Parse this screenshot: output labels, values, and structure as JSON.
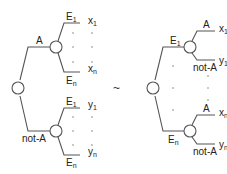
{
  "diagram": {
    "type": "decision-tree-equivalence",
    "relation_symbol": "~",
    "left_tree": {
      "root": "decision",
      "branches": [
        {
          "label": "A",
          "chance_node": true,
          "outcomes": [
            {
              "event": "E",
              "event_sub": "1",
              "result": "x",
              "result_sub": "1"
            },
            {
              "event": "E",
              "event_sub": "n",
              "result": "x",
              "result_sub": "n"
            }
          ]
        },
        {
          "label": "not-A",
          "chance_node": true,
          "outcomes": [
            {
              "event": "E",
              "event_sub": "1",
              "result": "y",
              "result_sub": "1"
            },
            {
              "event": "E",
              "event_sub": "n",
              "result": "y",
              "result_sub": "n"
            }
          ]
        }
      ]
    },
    "right_tree": {
      "root": "chance",
      "branches": [
        {
          "event": "E",
          "event_sub": "1",
          "decision_node": true,
          "outcomes": [
            {
              "label": "A",
              "result": "x",
              "result_sub": "1"
            },
            {
              "label": "not-A",
              "result": "y",
              "result_sub": "1"
            }
          ]
        },
        {
          "event": "E",
          "event_sub": "n",
          "decision_node": true,
          "outcomes": [
            {
              "label": "A",
              "result": "x",
              "result_sub": "n"
            },
            {
              "label": "not-A",
              "result": "y",
              "result_sub": "n"
            }
          ]
        }
      ]
    },
    "ellipsis": "·"
  }
}
